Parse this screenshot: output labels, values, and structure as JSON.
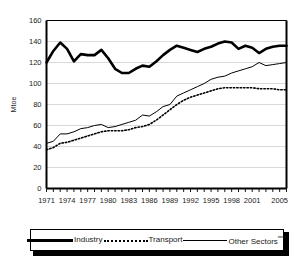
{
  "chart_data": {
    "type": "line",
    "title": "",
    "subtitle": "",
    "xlabel": "",
    "ylabel": "Mtoe",
    "ylim": [
      0,
      160
    ],
    "ytick_values": [
      0,
      20,
      40,
      60,
      80,
      100,
      120,
      140,
      160
    ],
    "ytick_labels": [
      "0",
      "20",
      "40",
      "60",
      "80",
      "100",
      "120",
      "140",
      "160"
    ],
    "grid": true,
    "legend_position": "bottom",
    "x": [
      1971,
      1972,
      1973,
      1974,
      1975,
      1976,
      1977,
      1978,
      1979,
      1980,
      1981,
      1982,
      1983,
      1984,
      1985,
      1986,
      1987,
      1988,
      1989,
      1990,
      1991,
      1992,
      1993,
      1994,
      1995,
      1996,
      1997,
      1998,
      1999,
      2000,
      2001,
      2002,
      2003,
      2004,
      2005,
      2006
    ],
    "xtick_labels": [
      "1971",
      "1974",
      "1977",
      "1980",
      "1983",
      "1986",
      "1989",
      "1992",
      "1995",
      "1998",
      "2001",
      "2005"
    ],
    "xtick_years": [
      1971,
      1974,
      1977,
      1980,
      1983,
      1986,
      1989,
      1992,
      1995,
      1998,
      2001,
      2005
    ],
    "series": [
      {
        "name": "Industry",
        "style": "thick-solid",
        "values": [
          120,
          131,
          139,
          133,
          121,
          128,
          127,
          127,
          132,
          124,
          114,
          110,
          110,
          114,
          117,
          116,
          121,
          127,
          132,
          136,
          134,
          132,
          130,
          133,
          135,
          138,
          140,
          139,
          133,
          136,
          134,
          129,
          133,
          135,
          136,
          136
        ]
      },
      {
        "name": "Transport",
        "style": "dotted",
        "values": [
          37,
          39,
          43,
          44,
          46,
          48,
          50,
          52,
          54,
          55,
          55,
          55,
          56,
          58,
          59,
          61,
          65,
          70,
          75,
          80,
          84,
          87,
          89,
          91,
          93,
          95,
          96,
          96,
          96,
          96,
          96,
          95,
          95,
          95,
          94,
          94
        ]
      },
      {
        "name": "Other Sectors****",
        "style": "thin-solid",
        "values": [
          43,
          45,
          52,
          52,
          54,
          57,
          58,
          60,
          61,
          58,
          59,
          61,
          63,
          65,
          70,
          69,
          73,
          78,
          80,
          88,
          91,
          94,
          97,
          100,
          104,
          106,
          107,
          110,
          112,
          114,
          116,
          120,
          117,
          118,
          119,
          120
        ]
      }
    ]
  },
  "legend": {
    "items": [
      {
        "label": "Industry",
        "swatch": "thick-solid-line-icon",
        "stars": ""
      },
      {
        "label": "Transport",
        "swatch": "dotted-line-icon",
        "stars": ""
      },
      {
        "label": "Other Sectors",
        "swatch": "thin-solid-line-icon",
        "stars": "****"
      }
    ]
  },
  "colors": {
    "line": "#000000",
    "grid": "#d9d9d9",
    "axis": "#000000",
    "background": "#ffffff",
    "tick_text": "#1a1a1a"
  }
}
